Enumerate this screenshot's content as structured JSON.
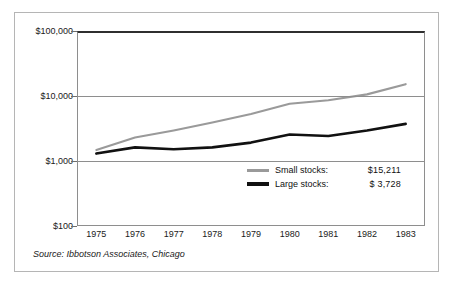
{
  "figure": {
    "source_note": "Source: Ibbotson Associates, Chicago"
  },
  "legend": {
    "items": [
      {
        "name": "Small stocks:",
        "value": "$15,211",
        "color": "#9a9a9a"
      },
      {
        "name": "Large stocks:",
        "value": "$  3,728",
        "color": "#111111"
      }
    ]
  },
  "chart_data": {
    "type": "line",
    "title": "",
    "subtitle": "",
    "xlabel": "",
    "ylabel": "",
    "yscale": "log",
    "ylim": [
      100,
      100000
    ],
    "grid": true,
    "legend_position": "inside-bottom-right",
    "ytick_labels": [
      "$100,000",
      "$10,000",
      "$1,000",
      "$100"
    ],
    "ytick_values": [
      100000,
      10000,
      1000,
      100
    ],
    "categories": [
      1975,
      1976,
      1977,
      1978,
      1979,
      1980,
      1981,
      1982,
      1983
    ],
    "xtick_labels": [
      "1975",
      "1976",
      "1977",
      "1978",
      "1979",
      "1980",
      "1981",
      "1982",
      "1983"
    ],
    "series": [
      {
        "name": "Small stocks",
        "color": "#9a9a9a",
        "final_value": "$15,211",
        "values": [
          1480,
          2300,
          2950,
          3900,
          5300,
          7600,
          8600,
          10600,
          15211
        ]
      },
      {
        "name": "Large stocks",
        "color": "#111111",
        "final_value": "$ 3,728",
        "values": [
          1300,
          1620,
          1520,
          1620,
          1920,
          2550,
          2420,
          2950,
          3728
        ]
      }
    ]
  }
}
